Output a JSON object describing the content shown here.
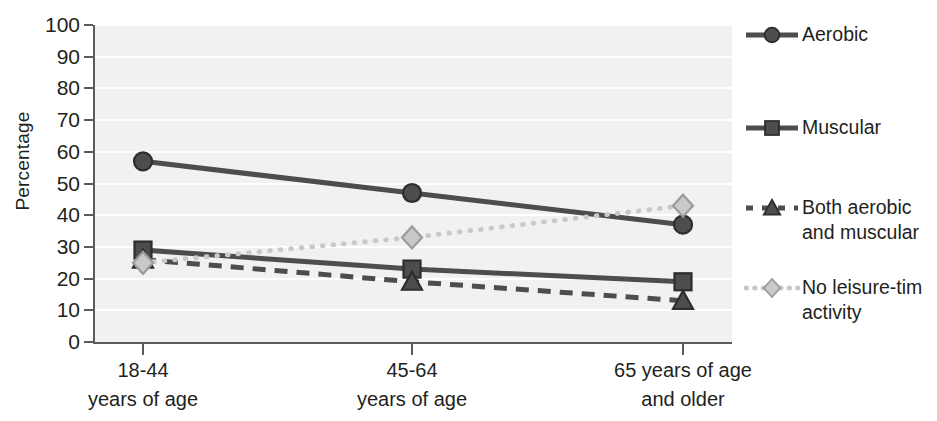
{
  "chart_data": {
    "type": "line",
    "title": "",
    "xlabel": "",
    "ylabel": "Percentage",
    "ylim": [
      0,
      100
    ],
    "ytick_values": [
      0,
      10,
      20,
      30,
      40,
      50,
      60,
      70,
      80,
      90,
      100
    ],
    "ytick_labels": [
      "0",
      "10",
      "20",
      "30",
      "40",
      "50",
      "60",
      "70",
      "80",
      "90",
      "100"
    ],
    "categories": [
      "18-44 years of age",
      "45-64 years of age",
      "65 years of age and older"
    ],
    "category_lines": [
      [
        "18-44",
        "years of age"
      ],
      [
        "45-64",
        "years of age"
      ],
      [
        "65 years of age",
        "and older"
      ]
    ],
    "grid": "horizontal-white-on-gray",
    "legend_position": "right",
    "series": [
      {
        "name": "Aerobic",
        "values": [
          57,
          47,
          37
        ],
        "marker": "circle",
        "linestyle": "solid",
        "color": "#4d4d4d"
      },
      {
        "name": "Muscular",
        "values": [
          29,
          23,
          19
        ],
        "marker": "square",
        "linestyle": "solid",
        "color": "#4d4d4d"
      },
      {
        "name": "Both aerobic\nand muscular",
        "values": [
          26,
          19,
          13
        ],
        "marker": "triangle",
        "linestyle": "dashed",
        "color": "#4d4d4d"
      },
      {
        "name": "No leisure-tim\nactivity",
        "values": [
          25,
          33,
          43
        ],
        "marker": "diamond",
        "linestyle": "dotted",
        "color": "#c9c9c9"
      }
    ]
  },
  "axis": {
    "y_title": "Percentage",
    "y_ticks": [
      "100",
      "90",
      "80",
      "70",
      "60",
      "50",
      "40",
      "30",
      "20",
      "10",
      "0"
    ],
    "x_ticks": [
      {
        "line1": "18-44",
        "line2": "years of age"
      },
      {
        "line1": "45-64",
        "line2": "years of age"
      },
      {
        "line1": "65 years of age",
        "line2": "and older"
      }
    ]
  },
  "legend": {
    "items": [
      {
        "label": "Aerobic",
        "marker": "circle-marker",
        "style": "solid-line"
      },
      {
        "label": "Muscular",
        "marker": "square-marker",
        "style": "solid-line"
      },
      {
        "label": "Both aerobic\nand muscular",
        "marker": "triangle-marker",
        "style": "dashed-line"
      },
      {
        "label": "No leisure-tim\nactivity",
        "marker": "diamond-marker",
        "style": "dotted-line"
      }
    ]
  },
  "colors": {
    "plot_background": "#f1f1f1",
    "gridline": "#ffffff",
    "axis": "#5b5b5b",
    "dark_series": "#4d4d4d",
    "light_series": "#c9c9c9",
    "text": "#231f20"
  }
}
